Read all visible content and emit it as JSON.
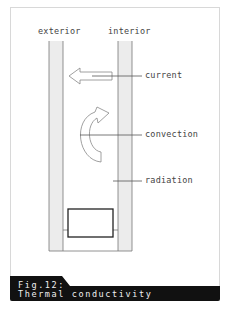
{
  "figure": {
    "labels": {
      "exterior": "exterior",
      "interior": "interior",
      "current": "current",
      "convection": "convection",
      "radiation": "radiation"
    },
    "caption": {
      "number": "Fig.12:",
      "title": "Thermal conductivity"
    },
    "icons": [
      "left-arrow-icon",
      "curved-arrow-icon"
    ],
    "colors": {
      "wall_fill": "#ececec",
      "line": "#555555",
      "caption_bg": "#111111",
      "caption_text": "#f0f0f0"
    }
  }
}
